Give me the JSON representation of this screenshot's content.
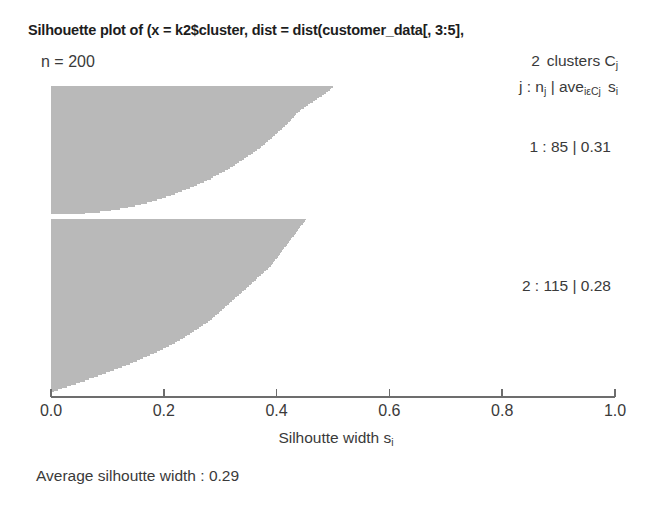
{
  "title": "Silhouette plot of (x = k2$cluster, dist = dist(customer_data[, 3:5],",
  "n_label": "n = 200",
  "legend": {
    "line1_prefix": "2",
    "line1_text": "clusters C",
    "line1_sub": "j",
    "line2_a": "j : n",
    "line2_a_sub": "j",
    "line2_b": "| ave",
    "line2_b_sub": "iεCj",
    "line2_c": "s",
    "line2_c_sub": "i"
  },
  "clusters": [
    {
      "id": "1",
      "label": "1 : 85 | 0.31",
      "n": 85,
      "avg": 0.31
    },
    {
      "id": "2",
      "label": "2 : 115 | 0.28",
      "n": 115,
      "avg": 0.28
    }
  ],
  "axis": {
    "ticks": [
      0.0,
      0.2,
      0.4,
      0.6,
      0.8,
      1.0
    ],
    "tick_labels": [
      "0.0",
      "0.2",
      "0.4",
      "0.6",
      "0.8",
      "1.0"
    ],
    "title_text": "Silhoutte width s",
    "title_sub": "i",
    "min": 0.0,
    "max": 1.0
  },
  "footer": "Average silhoutte width : 0.29",
  "colors": {
    "bar": "#b9b9b9",
    "axis": "#6d6d6d",
    "text": "#3a3a3a",
    "title": "#1d1d1d",
    "background": "#ffffff"
  },
  "chart_data": {
    "type": "bar",
    "title": "Silhouette plot of (x = k2$cluster, dist = dist(customer_data[, 3:5],",
    "xlabel": "Silhoutte width s_i",
    "ylabel": "",
    "xlim": [
      0.0,
      1.0
    ],
    "grid": false,
    "orientation": "horizontal",
    "overall_average_silhouette_width": 0.29,
    "total_n": 200,
    "n_clusters": 2,
    "series": [
      {
        "name": "Cluster 1",
        "n": 85,
        "average_silhouette_width": 0.31,
        "values": [
          0.5,
          0.497,
          0.494,
          0.491,
          0.488,
          0.484,
          0.48,
          0.476,
          0.472,
          0.468,
          0.464,
          0.46,
          0.456,
          0.452,
          0.448,
          0.444,
          0.441,
          0.438,
          0.435,
          0.432,
          0.43,
          0.428,
          0.426,
          0.424,
          0.421,
          0.418,
          0.415,
          0.412,
          0.409,
          0.406,
          0.403,
          0.4,
          0.397,
          0.394,
          0.391,
          0.388,
          0.385,
          0.382,
          0.379,
          0.376,
          0.373,
          0.37,
          0.366,
          0.362,
          0.358,
          0.354,
          0.35,
          0.346,
          0.342,
          0.338,
          0.334,
          0.33,
          0.326,
          0.322,
          0.318,
          0.313,
          0.308,
          0.303,
          0.298,
          0.293,
          0.288,
          0.283,
          0.277,
          0.271,
          0.265,
          0.259,
          0.253,
          0.247,
          0.24,
          0.233,
          0.226,
          0.219,
          0.212,
          0.204,
          0.196,
          0.188,
          0.179,
          0.17,
          0.16,
          0.149,
          0.137,
          0.123,
          0.107,
          0.087,
          0.06
        ]
      },
      {
        "name": "Cluster 2",
        "n": 115,
        "average_silhouette_width": 0.28,
        "values": [
          0.452,
          0.45,
          0.448,
          0.446,
          0.444,
          0.442,
          0.44,
          0.438,
          0.436,
          0.434,
          0.432,
          0.43,
          0.428,
          0.426,
          0.424,
          0.422,
          0.42,
          0.418,
          0.416,
          0.414,
          0.412,
          0.41,
          0.408,
          0.406,
          0.404,
          0.402,
          0.4,
          0.398,
          0.396,
          0.394,
          0.392,
          0.39,
          0.387,
          0.384,
          0.381,
          0.378,
          0.375,
          0.372,
          0.369,
          0.366,
          0.363,
          0.36,
          0.357,
          0.354,
          0.351,
          0.348,
          0.345,
          0.342,
          0.339,
          0.336,
          0.333,
          0.33,
          0.327,
          0.324,
          0.321,
          0.318,
          0.315,
          0.312,
          0.309,
          0.306,
          0.303,
          0.3,
          0.297,
          0.294,
          0.291,
          0.288,
          0.285,
          0.282,
          0.278,
          0.274,
          0.27,
          0.266,
          0.262,
          0.258,
          0.254,
          0.25,
          0.246,
          0.242,
          0.238,
          0.234,
          0.229,
          0.224,
          0.219,
          0.214,
          0.209,
          0.204,
          0.199,
          0.194,
          0.188,
          0.182,
          0.176,
          0.17,
          0.164,
          0.158,
          0.152,
          0.146,
          0.14,
          0.133,
          0.126,
          0.119,
          0.112,
          0.105,
          0.098,
          0.091,
          0.084,
          0.076,
          0.068,
          0.06,
          0.052,
          0.044,
          0.036,
          0.028,
          0.02,
          0.012,
          0.005
        ]
      }
    ]
  }
}
